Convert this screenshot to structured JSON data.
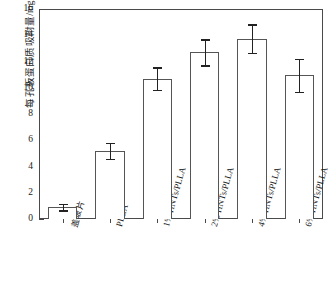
{
  "chart_data": {
    "type": "bar",
    "title": "",
    "xlabel": "",
    "ylabel": "每孔板蛋白质吸附量/mg",
    "ylim": [
      0,
      16
    ],
    "ytick_values": [
      0,
      2,
      4,
      6,
      8,
      10,
      12,
      14,
      16
    ],
    "ytick_labels": [
      "0",
      "2",
      "4",
      "6",
      "8",
      "10",
      "12",
      "14",
      "16"
    ],
    "minor_tick_step": 1,
    "grid": false,
    "legend": null,
    "categories": [
      "盖玻片",
      "PLLA",
      "1% HNTs/PLLA",
      "2% HNTs/PLLA",
      "4% HNTs/PLLA",
      "6% HNTs/PLLA"
    ],
    "values": [
      0.9,
      5.2,
      10.7,
      12.7,
      13.75,
      10.95
    ],
    "errors": [
      0.25,
      0.6,
      0.85,
      1.0,
      1.1,
      1.25
    ],
    "bar_fill": "#ffffff",
    "bar_edge": "#555555",
    "error_color": "#222222",
    "axis_color": "#4a4a4a"
  }
}
